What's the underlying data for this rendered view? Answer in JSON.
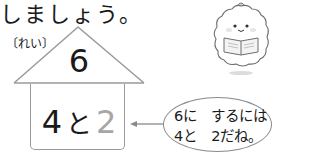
{
  "heading": {
    "text": "しましょう。"
  },
  "example_label": "〔れい〕",
  "house": {
    "roof_number": "6",
    "parts": {
      "left": "4",
      "connector": "と",
      "right": "2"
    },
    "right_color": "#a6a6a6"
  },
  "speech_bubble": {
    "line1": "6に　するには",
    "line2": "4と　2だね。"
  },
  "arrow": {
    "direction": "left"
  },
  "character": {
    "icon": "reading-character-icon"
  },
  "colors": {
    "line": "#9a9a9a",
    "text": "#1a1a1a",
    "accent_gray": "#a6a6a6"
  }
}
